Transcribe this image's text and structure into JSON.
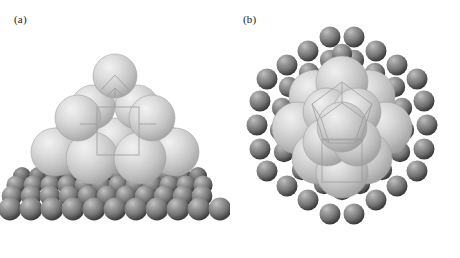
{
  "figure": {
    "type": "scientific-illustration",
    "background_color": "#ffffff",
    "panels": [
      {
        "id": "a",
        "label": "(a)",
        "view": "perspective side view",
        "description": "Pyramidal metal cluster of light spheres resting on a darker substrate lattice",
        "cluster": {
          "color": "#d4d4d4",
          "layers": [
            {
              "name": "base",
              "count": 9,
              "arrangement": "3x3"
            },
            {
              "name": "middle",
              "count": 4,
              "arrangement": "2x2"
            },
            {
              "name": "apex",
              "count": 1,
              "arrangement": "1x1"
            }
          ],
          "total_atoms": 14
        },
        "substrate": {
          "color": "#8a8a8a",
          "rows": 4,
          "columns": 17,
          "description": "dark gray support atoms in receding rows"
        },
        "overlay": {
          "unit_cell_outline": true,
          "outline_color": "#9a9a9a"
        }
      },
      {
        "id": "b",
        "label": "(b)",
        "view": "top-down plan view",
        "description": "Same cluster viewed from above, encircled by a hexagonal ring of substrate atoms",
        "cluster": {
          "color": "#cfcfcf",
          "total_atoms": 14
        },
        "substrate": {
          "color": "#8a8a8a",
          "ring_shape": "hexagonal",
          "ring_count": 2,
          "atoms_outer_ring": 24,
          "atoms_inner_ring": 18
        },
        "overlay": {
          "unit_cell_outline": true,
          "outline_color": "#9a9a9a"
        }
      }
    ],
    "colors": {
      "cluster_light": "#d4d4d4",
      "cluster_light_highlight": "#ededed",
      "cluster_light_shadow": "#a9a9a9",
      "substrate_dark": "#8a8a8a",
      "substrate_dark_highlight": "#b8b8b8",
      "substrate_dark_shadow": "#3c3c3c",
      "outline": "#9a9a9a",
      "label_text": "#1a1a1a"
    }
  }
}
